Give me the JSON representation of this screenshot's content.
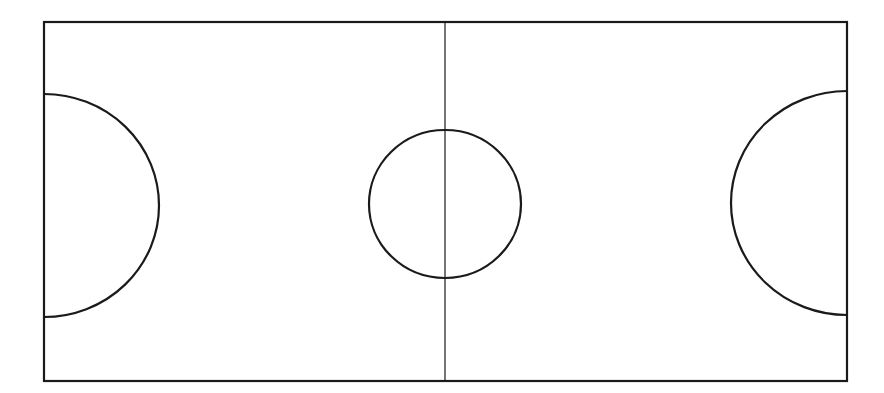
{
  "diagram": {
    "type": "court-layout",
    "canvas": {
      "width": 884,
      "height": 393,
      "background": "#ffffff"
    },
    "stroke_color": "#1a1a1a",
    "boundary": {
      "x": 44,
      "y": 22,
      "width": 803,
      "height": 359,
      "stroke_width": 2.2
    },
    "center_line": {
      "x": 445,
      "y1": 22,
      "y2": 381,
      "stroke_width": 1.2
    },
    "center_circle": {
      "cx": 445,
      "cy": 204,
      "rx": 76,
      "ry": 74,
      "stroke_width": 2.2
    },
    "left_arc": {
      "cx": 44,
      "cy": 205.5,
      "rx": 115,
      "ry": 111.5,
      "stroke_width": 2.2
    },
    "right_arc": {
      "cx": 847,
      "cy": 203,
      "rx": 116,
      "ry": 112,
      "stroke_width": 2.2
    }
  }
}
